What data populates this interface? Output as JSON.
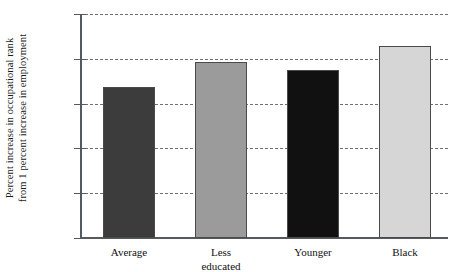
{
  "chart_data": {
    "type": "bar",
    "title": "",
    "subtitle": "",
    "xlabel": "",
    "ylabel": "Percent increase in occupational rank from 1 percent increase in employment",
    "ylabel_lines": [
      "Percent increase in occupational rank",
      "from 1 percent increase in employment"
    ],
    "categories": [
      "Average",
      "Less educated",
      "Younger",
      "Black"
    ],
    "category_lines": [
      [
        "Average"
      ],
      [
        "Less",
        "educated"
      ],
      [
        "Younger"
      ],
      [
        "Black"
      ]
    ],
    "values": [
      0.168,
      0.196,
      0.188,
      0.214
    ],
    "bar_colors": [
      "#3c3c3c",
      "#9b9b9b",
      "#111111",
      "#d6d6d6"
    ],
    "bar_edge_color": "#4a4a4a",
    "ylim": [
      0.0,
      0.25
    ],
    "yticks": [
      0.0,
      0.05,
      0.1,
      0.15,
      0.2,
      0.25
    ],
    "ytick_labels": [
      "0.000",
      "0.050",
      "0.100",
      "0.150",
      "0.200",
      "0.250"
    ],
    "grid": true,
    "grid_axis": "y",
    "grid_style": "dashed",
    "grid_color": "#707070",
    "legend": false,
    "legend_position": "none",
    "background_color": "#ffffff",
    "axis_color": "#555a5f"
  }
}
